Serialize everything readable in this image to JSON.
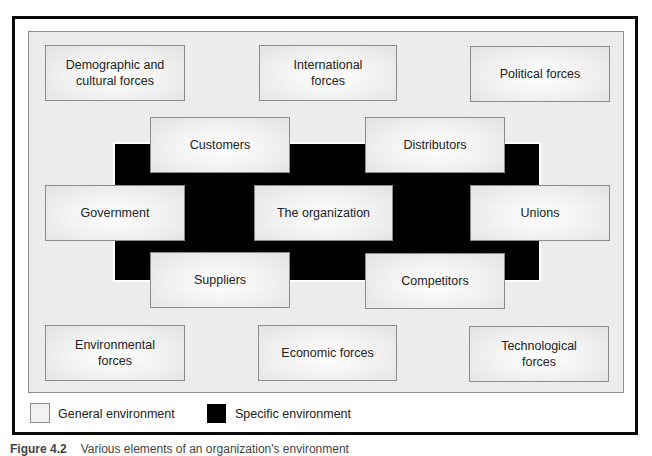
{
  "diagram": {
    "general_forces": [
      {
        "id": "demographic",
        "label": "Demographic and\ncultural forces"
      },
      {
        "id": "international",
        "label": "International\nforces"
      },
      {
        "id": "political",
        "label": "Political forces"
      },
      {
        "id": "environmental",
        "label": "Environmental\nforces"
      },
      {
        "id": "economic",
        "label": "Economic forces"
      },
      {
        "id": "technological",
        "label": "Technological\nforces"
      }
    ],
    "specific_forces": [
      {
        "id": "customers",
        "label": "Customers"
      },
      {
        "id": "distributors",
        "label": "Distributors"
      },
      {
        "id": "government",
        "label": "Government"
      },
      {
        "id": "unions",
        "label": "Unions"
      },
      {
        "id": "suppliers",
        "label": "Suppliers"
      },
      {
        "id": "competitors",
        "label": "Competitors"
      }
    ],
    "center": {
      "label": "The organization"
    }
  },
  "legend": {
    "general": {
      "label": "General environment",
      "color": "#ececec"
    },
    "specific": {
      "label": "Specific environment",
      "color": "#000000"
    }
  },
  "caption": {
    "number": "Figure 4.2",
    "text": "Various elements of an organization's environment"
  }
}
